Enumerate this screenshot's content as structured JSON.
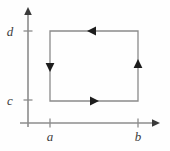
{
  "figure": {
    "background_color": "#fefefe",
    "axis_color": "#8c8c8c",
    "contour_color": "#8a8a8a",
    "arrow_color": "#1d1d1d",
    "label_color": "#3c3c3c"
  },
  "axes": {
    "x_axis": {
      "name": "horizontal-axis",
      "y_position": 123,
      "x_start": 20,
      "x_end": 159,
      "arrow_direction": "right"
    },
    "y_axis": {
      "name": "vertical-axis",
      "x_position": 28,
      "y_start": 125,
      "y_end": 8,
      "arrow_direction": "up"
    }
  },
  "ticks": {
    "x": [
      {
        "label": "a",
        "pixel": 50,
        "label_x": 47,
        "label_y": 141
      },
      {
        "label": "b",
        "pixel": 138,
        "label_x": 135,
        "label_y": 141
      }
    ],
    "y": [
      {
        "label": "c",
        "pixel": 100,
        "label_x": 10,
        "label_y": 105
      },
      {
        "label": "d",
        "pixel": 31,
        "label_x": 10,
        "label_y": 36
      }
    ]
  },
  "contour": {
    "name": "rectangle-contour",
    "left": 50,
    "right": 138,
    "top": 31,
    "bottom": 101,
    "orientation": "clockwise",
    "corners": [
      {
        "name": "bottom-left",
        "x": 50,
        "y": 101
      },
      {
        "name": "top-left",
        "x": 50,
        "y": 31
      },
      {
        "name": "top-right",
        "x": 138,
        "y": 31
      },
      {
        "name": "bottom-right",
        "x": 138,
        "y": 101
      }
    ],
    "direction_arrows": [
      {
        "name": "top-edge-arrow",
        "edge": "top",
        "x": 93,
        "y": 31,
        "points": "left"
      },
      {
        "name": "bottom-edge-arrow",
        "edge": "bottom",
        "x": 93,
        "y": 101,
        "points": "right"
      },
      {
        "name": "left-edge-arrow",
        "edge": "left",
        "x": 50,
        "y": 66,
        "points": "down"
      },
      {
        "name": "right-edge-arrow",
        "edge": "right",
        "x": 138,
        "y": 66,
        "points": "up"
      }
    ]
  }
}
